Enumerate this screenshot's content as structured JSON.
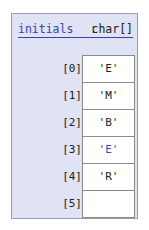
{
  "variable": {
    "name": "initials",
    "separator": ":",
    "type": "char[]"
  },
  "elements": [
    {
      "index": "[0]",
      "value": "'E'",
      "highlight": false
    },
    {
      "index": "[1]",
      "value": "'M'",
      "highlight": false
    },
    {
      "index": "[2]",
      "value": "'B'",
      "highlight": false
    },
    {
      "index": "[3]",
      "value": "'E'",
      "highlight": true
    },
    {
      "index": "[4]",
      "value": "'R'",
      "highlight": false
    },
    {
      "index": "[5]",
      "value": "",
      "highlight": false
    }
  ],
  "colors": {
    "frame_bg": "#dfe3f4",
    "name_color": "#3d3fa8",
    "highlight_color": "#4a44b0"
  }
}
